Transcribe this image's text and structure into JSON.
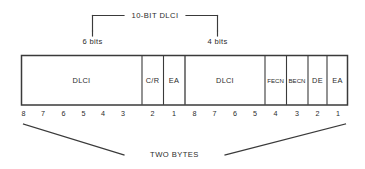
{
  "diagram": {
    "title_annotation": "10-BIT DLCI",
    "left_span_label": "6 bits",
    "right_span_label": "4 bits",
    "bottom_label": "TWO BYTES",
    "line_color": "#3a3a3a",
    "text_color": "#2b2b2b",
    "background_color": "#ffffff"
  },
  "header_fields": [
    {
      "name": "DLCI",
      "bits": 6,
      "byte": 1,
      "style": "wide"
    },
    {
      "name": "C/R",
      "bits": 1,
      "byte": 1,
      "style": "wide"
    },
    {
      "name": "EA",
      "bits": 1,
      "byte": 1,
      "style": "wide"
    },
    {
      "name": "DLCI",
      "bits": 4,
      "byte": 2,
      "style": "wide"
    },
    {
      "name": "FECN",
      "bits": 1,
      "byte": 2,
      "style": "narrow"
    },
    {
      "name": "BECN",
      "bits": 1,
      "byte": 2,
      "style": "narrow"
    },
    {
      "name": "DE",
      "bits": 1,
      "byte": 2,
      "style": "wide"
    },
    {
      "name": "EA",
      "bits": 1,
      "byte": 2,
      "style": "wide"
    }
  ],
  "bit_numbers": {
    "byte1": [
      "8",
      "7",
      "6",
      "5",
      "4",
      "3",
      "2",
      "1"
    ],
    "byte2": [
      "8",
      "7",
      "6",
      "5",
      "4",
      "3",
      "2",
      "1"
    ]
  }
}
